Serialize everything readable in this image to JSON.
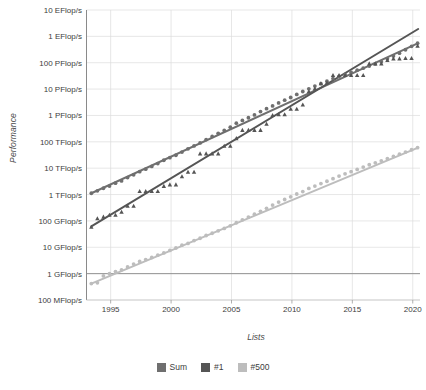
{
  "chart_data": {
    "type": "scatter",
    "title": "",
    "subtitle": "",
    "xlabel": "Lists",
    "ylabel": "Performance",
    "yscale": "log",
    "grid": true,
    "legend_position": "bottom",
    "xlim": [
      1993,
      2020.6
    ],
    "ylim_flops": [
      100000000.0,
      1e+19
    ],
    "xticks": [
      "1995",
      "2000",
      "2005",
      "2010",
      "2015",
      "2020"
    ],
    "xtick_values": [
      1995,
      2000,
      2005,
      2010,
      2015,
      2020
    ],
    "yticks": [
      "10 EFlop/s",
      "1 EFlop/s",
      "100 PFlop/s",
      "10 PFlop/s",
      "1 PFlop/s",
      "100 TFlop/s",
      "10 TFlop/s",
      "1 TFlop/s",
      "100 GFlop/s",
      "10 GFlop/s",
      "1 GFlop/s",
      "100 MFlop/s"
    ],
    "ytick_values": [
      1e+19,
      1e+18,
      1e+17,
      1e+16,
      1000000000000000.0,
      100000000000000.0,
      10000000000000.0,
      1000000000000.0,
      100000000000.0,
      10000000000.0,
      1000000000.0,
      100000000.0
    ],
    "series": [
      {
        "name": "Sum",
        "color": "#6f6f6f",
        "marker": "circle",
        "x": [
          1993.4,
          1993.9,
          1994.4,
          1994.9,
          1995.4,
          1995.9,
          1996.4,
          1996.9,
          1997.4,
          1997.9,
          1998.4,
          1998.9,
          1999.4,
          1999.9,
          2000.4,
          2000.9,
          2001.4,
          2001.9,
          2002.4,
          2002.9,
          2003.4,
          2003.9,
          2004.4,
          2004.9,
          2005.4,
          2005.9,
          2006.4,
          2006.9,
          2007.4,
          2007.9,
          2008.4,
          2008.9,
          2009.4,
          2009.9,
          2010.4,
          2010.9,
          2011.4,
          2011.9,
          2012.4,
          2012.9,
          2013.4,
          2013.9,
          2014.4,
          2014.9,
          2015.4,
          2015.9,
          2016.4,
          2016.9,
          2017.4,
          2017.9,
          2018.4,
          2018.9,
          2019.4,
          2019.9,
          2020.4
        ],
        "y": [
          1120000000000.0,
          1380000000000.0,
          1730000000000.0,
          2100000000000.0,
          2700000000000.0,
          3300000000000.0,
          4400000000000.0,
          5600000000000.0,
          7400000000000.0,
          9200000000000.0,
          11700000000000.0,
          15000000000000.0,
          20000000000000.0,
          25000000000000.0,
          31000000000000.0,
          41000000000000.0,
          54000000000000.0,
          70000000000000.0,
          91000000000000.0,
          122000000000000.0,
          160000000000000.0,
          210000000000000.0,
          270000000000000.0,
          360000000000000.0,
          510000000000000.0,
          650000000000000.0,
          820000000000000.0,
          1050000000000000.0,
          1400000000000000.0,
          1800000000000000.0,
          2300000000000000.0,
          3000000000000000.0,
          3800000000000000.0,
          4800000000000000.0,
          6300000000000000.0,
          8100000000000000.0,
          1.02e+16,
          1.3e+16,
          1.6e+16,
          2e+16,
          2.5e+16,
          3e+16,
          3.6e+16,
          4.3e+16,
          5.2e+16,
          6.2e+16,
          7.5e+16,
          9e+16,
          1.1e+17,
          1.4e+17,
          1.8e+17,
          2.3e+17,
          3.1e+17,
          4.2e+17,
          5.5e+17
        ]
      },
      {
        "name": "#1",
        "color": "#555555",
        "marker": "triangle",
        "x": [
          1993.4,
          1993.9,
          1994.4,
          1994.9,
          1995.4,
          1995.9,
          1996.4,
          1996.9,
          1997.4,
          1997.9,
          1998.4,
          1998.9,
          1999.4,
          1999.9,
          2000.4,
          2000.9,
          2001.4,
          2001.9,
          2002.4,
          2002.9,
          2003.4,
          2003.9,
          2004.4,
          2004.9,
          2005.4,
          2005.9,
          2006.4,
          2006.9,
          2007.4,
          2007.9,
          2008.4,
          2008.9,
          2009.4,
          2009.9,
          2010.4,
          2010.9,
          2011.4,
          2011.9,
          2012.4,
          2012.9,
          2013.4,
          2013.9,
          2014.4,
          2014.9,
          2015.4,
          2015.9,
          2016.4,
          2016.9,
          2017.4,
          2017.9,
          2018.4,
          2018.9,
          2019.4,
          2019.9,
          2020.4
        ],
        "y": [
          59000000000.0,
          124000000000.0,
          143000000000.0,
          170000000000.0,
          170000000000.0,
          220000000000.0,
          370000000000.0,
          370000000000.0,
          1340000000000.0,
          1340000000000.0,
          1340000000000.0,
          1340000000000.0,
          2100000000000.0,
          2400000000000.0,
          2400000000000.0,
          4900000000000.0,
          7200000000000.0,
          7200000000000.0,
          36000000000000.0,
          36000000000000.0,
          36000000000000.0,
          36000000000000.0,
          70000000000000.0,
          70000000000000.0,
          136000000000000.0,
          280000000000000.0,
          280000000000000.0,
          280000000000000.0,
          280000000000000.0,
          480000000000000.0,
          1030000000000000.0,
          1100000000000000.0,
          1100000000000000.0,
          1760000000000000.0,
          1760000000000000.0,
          2570000000000000.0,
          8200000000000000.0,
          1.05e+16,
          1.63e+16,
          1.76e+16,
          3.4e+16,
          3.4e+16,
          3.4e+16,
          3.4e+16,
          3.4e+16,
          3.4e+16,
          9.3e+16,
          9.3e+16,
          9.3e+16,
          1.25e+17,
          1.44e+17,
          1.44e+17,
          1.48e+17,
          1.48e+17,
          4.4e+17
        ]
      },
      {
        "name": "#500",
        "color": "#bdbdbd",
        "marker": "circle",
        "x": [
          1993.4,
          1993.9,
          1994.4,
          1994.9,
          1995.4,
          1995.9,
          1996.4,
          1996.9,
          1997.4,
          1997.9,
          1998.4,
          1998.9,
          1999.4,
          1999.9,
          2000.4,
          2000.9,
          2001.4,
          2001.9,
          2002.4,
          2002.9,
          2003.4,
          2003.9,
          2004.4,
          2004.9,
          2005.4,
          2005.9,
          2006.4,
          2006.9,
          2007.4,
          2007.9,
          2008.4,
          2008.9,
          2009.4,
          2009.9,
          2010.4,
          2010.9,
          2011.4,
          2011.9,
          2012.4,
          2012.9,
          2013.4,
          2013.9,
          2014.4,
          2014.9,
          2015.4,
          2015.9,
          2016.4,
          2016.9,
          2017.4,
          2017.9,
          2018.4,
          2018.9,
          2019.4,
          2019.9,
          2020.4
        ],
        "y": [
          420000000.0,
          450000000.0,
          820000000.0,
          1000000000.0,
          1200000000.0,
          1400000000.0,
          1800000000.0,
          2300000000.0,
          2900000000.0,
          3400000000.0,
          4100000000.0,
          5000000000.0,
          6100000000.0,
          7600000000.0,
          9400000000.0,
          12000000000.0,
          14000000000.0,
          18000000000.0,
          22000000000.0,
          28000000000.0,
          34000000000.0,
          42000000000.0,
          52000000000.0,
          65000000000.0,
          85000000000.0,
          110000000000.0,
          140000000000.0,
          180000000000.0,
          230000000000.0,
          300000000000.0,
          400000000000.0,
          520000000000.0,
          650000000000.0,
          820000000000.0,
          1050000000000.0,
          1300000000000.0,
          1700000000000.0,
          2100000000000.0,
          2600000000000.0,
          3200000000000.0,
          4000000000000.0,
          5000000000000.0,
          6100000000000.0,
          7400000000000.0,
          9000000000000.0,
          11000000000000.0,
          13500000000000.0,
          16000000000000.0,
          19000000000000.0,
          23000000000000.0,
          28000000000000.0,
          34000000000000.0,
          41000000000000.0,
          50000000000000.0,
          60000000000000.0
        ]
      }
    ],
    "trendlines": [
      {
        "name": "Sum",
        "color": "#6f6f6f",
        "x0": 1993.4,
        "y0": 1120000000000.0,
        "x1": 2020.45,
        "y1": 5.5e+17
      },
      {
        "name": "#1",
        "color": "#555555",
        "x0": 1993.4,
        "y0": 62000000000.0,
        "x1": 2020.45,
        "y1": 1.9e+18
      },
      {
        "name": "#500",
        "color": "#bdbdbd",
        "x0": 1993.4,
        "y0": 420000000.0,
        "x1": 2020.45,
        "y1": 60000000000000.0
      }
    ],
    "reference_line": {
      "label": "1 GFlop/s",
      "value": 1000000000.0,
      "color": "#8a8a8a"
    }
  },
  "legend": {
    "items": [
      {
        "label": "Sum",
        "color": "#6f6f6f"
      },
      {
        "label": "#1",
        "color": "#555555"
      },
      {
        "label": "#500",
        "color": "#bdbdbd"
      }
    ]
  },
  "axes": {
    "y_title": "Performance",
    "x_title": "Lists"
  }
}
